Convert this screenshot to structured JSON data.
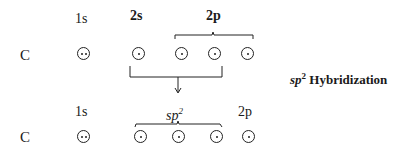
{
  "element": "C",
  "title": "sp2 Hybridization",
  "title_parts": {
    "base": "sp",
    "sup": "2",
    "rest": " Hybridization"
  },
  "ground_state": {
    "element_label": "C",
    "orbital_labels": {
      "s1": "1s",
      "s2": "2s",
      "p2": "2p"
    },
    "orbitals": [
      {
        "name": "1s",
        "electrons": 2
      },
      {
        "name": "2s",
        "electrons": 1
      },
      {
        "name": "2p",
        "electrons": 1
      },
      {
        "name": "2p",
        "electrons": 1
      },
      {
        "name": "2p",
        "electrons": 1
      }
    ]
  },
  "hybridized_state": {
    "element_label": "C",
    "orbital_labels": {
      "s1": "1s",
      "sp_base": "sp",
      "sp_sup": "2",
      "p2": "2p"
    },
    "orbitals": [
      {
        "name": "1s",
        "electrons": 2
      },
      {
        "name": "sp2",
        "electrons": 1
      },
      {
        "name": "sp2",
        "electrons": 1
      },
      {
        "name": "sp2",
        "electrons": 1
      },
      {
        "name": "2p",
        "electrons": 1
      }
    ]
  }
}
